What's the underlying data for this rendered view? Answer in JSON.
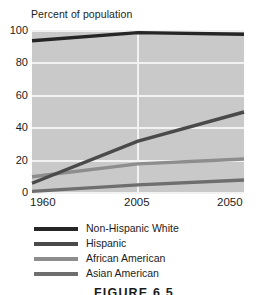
{
  "chart_data": {
    "type": "line",
    "title": "",
    "ylabel": "Percent of population",
    "xlabel": "",
    "x": [
      1960,
      2005,
      2050
    ],
    "xtick_labels": [
      "1960",
      "2005",
      "2050"
    ],
    "ytick_labels": [
      "100",
      "80",
      "60",
      "40",
      "20",
      "0"
    ],
    "ylim": [
      0,
      100
    ],
    "xlim": [
      1960,
      2050
    ],
    "grid": "horizontal-and-vertical-white",
    "legend_position": "below-plot",
    "plot_background": "#c9c9c9",
    "series": [
      {
        "name": "Non-Hispanic White",
        "color": "#262626",
        "values": [
          94,
          99,
          98
        ]
      },
      {
        "name": "Hispanic",
        "color": "#4a4a4a",
        "values": [
          6,
          32,
          50
        ]
      },
      {
        "name": "African American",
        "color": "#8d8d8d",
        "values": [
          10,
          18,
          21
        ]
      },
      {
        "name": "Asian American",
        "color": "#6e6e6e",
        "values": [
          1,
          5,
          8
        ]
      }
    ]
  },
  "caption": {
    "text": "FIGURE 6.5"
  }
}
